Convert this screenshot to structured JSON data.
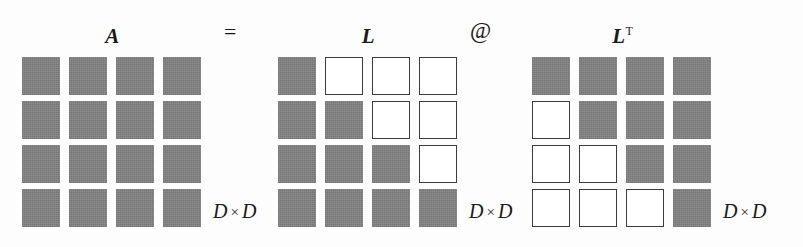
{
  "figure": {
    "background_color": "#fdfdfd",
    "filled_cell_color": "#828282",
    "empty_cell_color": "#ffffff",
    "cell_border_color": "#3c3c3c",
    "text_color": "#1a1a1a"
  },
  "operators": {
    "equals": "=",
    "matmul": "@"
  },
  "matrices": [
    {
      "id": "A",
      "label": "A",
      "superscript": "",
      "dimension_label": "D × D",
      "dimension_symbol": "D",
      "dimension_operator": "×",
      "rows": 4,
      "cols": 4,
      "pattern": "dense",
      "cells": [
        [
          "filled",
          "filled",
          "filled",
          "filled"
        ],
        [
          "filled",
          "filled",
          "filled",
          "filled"
        ],
        [
          "filled",
          "filled",
          "filled",
          "filled"
        ],
        [
          "filled",
          "filled",
          "filled",
          "filled"
        ]
      ]
    },
    {
      "id": "L",
      "label": "L",
      "superscript": "",
      "dimension_label": "D × D",
      "dimension_symbol": "D",
      "dimension_operator": "×",
      "rows": 4,
      "cols": 4,
      "pattern": "lower-triangular",
      "cells": [
        [
          "filled",
          "empty",
          "empty",
          "empty"
        ],
        [
          "filled",
          "filled",
          "empty",
          "empty"
        ],
        [
          "filled",
          "filled",
          "filled",
          "empty"
        ],
        [
          "filled",
          "filled",
          "filled",
          "filled"
        ]
      ]
    },
    {
      "id": "LT",
      "label": "L",
      "superscript": "T",
      "dimension_label": "D × D",
      "dimension_symbol": "D",
      "dimension_operator": "×",
      "rows": 4,
      "cols": 4,
      "pattern": "upper-triangular",
      "cells": [
        [
          "filled",
          "filled",
          "filled",
          "filled"
        ],
        [
          "empty",
          "filled",
          "filled",
          "filled"
        ],
        [
          "empty",
          "empty",
          "filled",
          "filled"
        ],
        [
          "empty",
          "empty",
          "empty",
          "filled"
        ]
      ]
    }
  ]
}
